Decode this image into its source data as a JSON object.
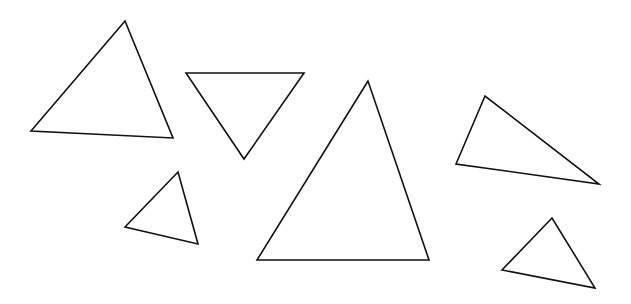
{
  "canvas": {
    "width": 631,
    "height": 304,
    "background": "#ffffff",
    "stroke": "#111111"
  },
  "shapes": [
    {
      "id": "triangle-1",
      "points": "125,21 31,131 173,138"
    },
    {
      "id": "triangle-2",
      "points": "186,73 304,73 244,159"
    },
    {
      "id": "triangle-3",
      "points": "368,81 257,260 429,260"
    },
    {
      "id": "triangle-4",
      "points": "178,172 125,227 198,244"
    },
    {
      "id": "triangle-5",
      "points": "485,96 456,164 599,184"
    },
    {
      "id": "triangle-6",
      "points": "552,218 502,270 595,288"
    }
  ]
}
